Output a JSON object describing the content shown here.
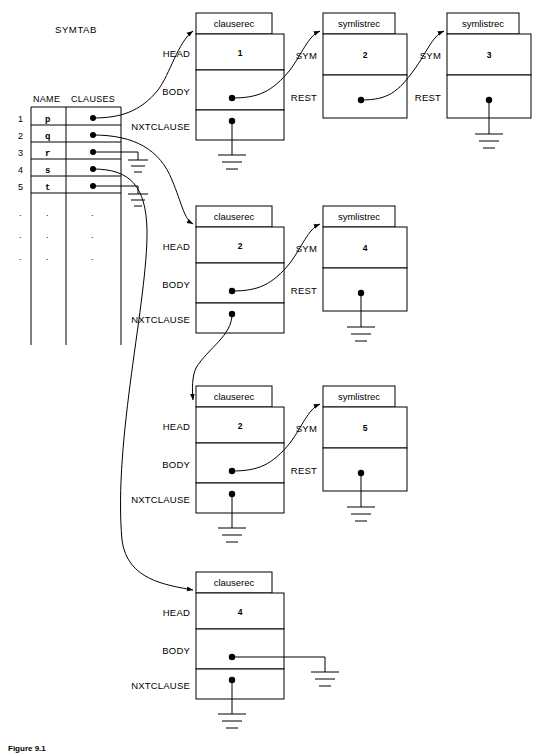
{
  "figure": {
    "caption": "Figure 9.1",
    "symtab_title": "SYMTAB",
    "record_type_clause": "clauserec",
    "record_type_symlist": "symlistrec",
    "colors": {
      "ink": "#000000",
      "paper": "#ffffff"
    }
  },
  "symtab": {
    "title": "SYMTAB",
    "columns": [
      "NAME",
      "CLAUSES"
    ],
    "rows": [
      {
        "index": "1",
        "name": "p"
      },
      {
        "index": "2",
        "name": "q"
      },
      {
        "index": "3",
        "name": "r"
      },
      {
        "index": "4",
        "name": "s"
      },
      {
        "index": "5",
        "name": "t"
      }
    ],
    "ellipsis_rows": [
      {
        "index": ".",
        "name": ".",
        "clauses": "."
      },
      {
        "index": ".",
        "name": ".",
        "clauses": "."
      },
      {
        "index": ".",
        "name": ".",
        "clauses": "."
      }
    ]
  },
  "clause_records": [
    {
      "id": "clauserec-1",
      "type": "clauserec",
      "fields": [
        {
          "label": "HEAD",
          "value": "1"
        },
        {
          "label": "BODY",
          "value": ""
        },
        {
          "label": "NXTCLAUSE",
          "value": ""
        }
      ],
      "head_value": "1",
      "body_target": "symlistrec-1",
      "nxtclause_target": "ground"
    },
    {
      "id": "clauserec-2",
      "type": "clauserec",
      "fields": [
        {
          "label": "HEAD",
          "value": "2"
        },
        {
          "label": "BODY",
          "value": ""
        },
        {
          "label": "NXTCLAUSE",
          "value": ""
        }
      ],
      "head_value": "2",
      "body_target": "symlistrec-3",
      "nxtclause_target": "clauserec-3"
    },
    {
      "id": "clauserec-3",
      "type": "clauserec",
      "fields": [
        {
          "label": "HEAD",
          "value": "2"
        },
        {
          "label": "BODY",
          "value": ""
        },
        {
          "label": "NXTCLAUSE",
          "value": ""
        }
      ],
      "head_value": "2",
      "body_target": "symlistrec-4",
      "nxtclause_target": "ground"
    },
    {
      "id": "clauserec-4",
      "type": "clauserec",
      "fields": [
        {
          "label": "HEAD",
          "value": "4"
        },
        {
          "label": "BODY",
          "value": ""
        },
        {
          "label": "NXTCLAUSE",
          "value": ""
        }
      ],
      "head_value": "4",
      "body_target": "ground",
      "nxtclause_target": "ground"
    }
  ],
  "symlist_records": [
    {
      "id": "symlistrec-1",
      "type": "symlistrec",
      "fields": [
        {
          "label": "SYM",
          "value": "2"
        },
        {
          "label": "REST",
          "value": ""
        }
      ],
      "sym_value": "2",
      "rest_target": "symlistrec-2"
    },
    {
      "id": "symlistrec-2",
      "type": "symlistrec",
      "fields": [
        {
          "label": "SYM",
          "value": "3"
        },
        {
          "label": "REST",
          "value": ""
        }
      ],
      "sym_value": "3",
      "rest_target": "ground"
    },
    {
      "id": "symlistrec-3",
      "type": "symlistrec",
      "fields": [
        {
          "label": "SYM",
          "value": "4"
        },
        {
          "label": "REST",
          "value": ""
        }
      ],
      "sym_value": "4",
      "rest_target": "ground"
    },
    {
      "id": "symlistrec-4",
      "type": "symlistrec",
      "fields": [
        {
          "label": "SYM",
          "value": "5"
        },
        {
          "label": "REST",
          "value": ""
        }
      ],
      "sym_value": "5",
      "rest_target": "ground"
    }
  ]
}
